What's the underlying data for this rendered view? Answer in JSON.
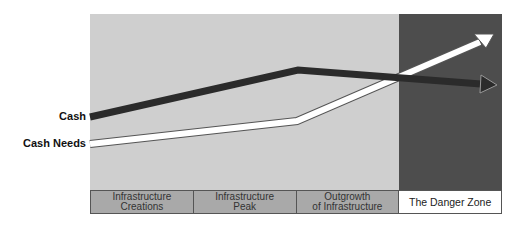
{
  "diagram": {
    "series": [
      {
        "name": "Cash",
        "color": "#2b2b2b",
        "points": [
          [
            90,
            117
          ],
          [
            298,
            70
          ],
          [
            480,
            84
          ]
        ],
        "arrow_tip": [
          497,
          85
        ]
      },
      {
        "name": "Cash Needs",
        "color": "#ffffff",
        "points": [
          [
            90,
            144
          ],
          [
            297,
            121
          ],
          [
            478,
            43
          ]
        ],
        "arrow_tip": [
          494,
          34
        ]
      }
    ],
    "labels": {
      "cash": "Cash",
      "cash_needs": "Cash Needs"
    },
    "phases": [
      {
        "label": "Infrastructure\nCreations"
      },
      {
        "label": "Infrastructure\nPeak"
      },
      {
        "label": "Outgrowth\nof Infrastructure"
      },
      {
        "label": "The Danger Zone"
      }
    ],
    "colors": {
      "background_area": "#cfcfcf",
      "danger_zone": "#4d4d4d",
      "phase_band": "#a9a9a9"
    }
  }
}
